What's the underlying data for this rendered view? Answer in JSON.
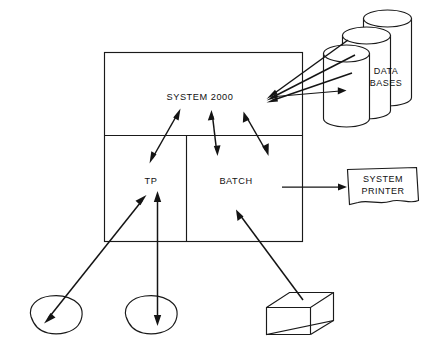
{
  "diagram": {
    "title_text": "SYSTEM 2000",
    "nodes": {
      "system": {
        "label": "SYSTEM 2000",
        "name": "system-2000-box"
      },
      "tp": {
        "label": "TP",
        "name": "tp-compartment"
      },
      "batch": {
        "label": "BATCH",
        "name": "batch-compartment"
      },
      "databases": {
        "label_line1": "DATA",
        "label_line2": "BASES",
        "name": "data-bases-cylinders",
        "count": 3
      },
      "printer": {
        "label_line1": "SYSTEM",
        "label_line2": "PRINTER",
        "name": "system-printer-box"
      },
      "terminal_left": {
        "label": "",
        "name": "terminal-left-blob"
      },
      "terminal_middle": {
        "label": "",
        "name": "terminal-middle-blob"
      },
      "card_deck": {
        "label": "",
        "name": "card-deck-box"
      }
    },
    "connections": [
      {
        "name": "databases-to-system-link-1",
        "from": "databases",
        "to": "system",
        "style": "single-arrow"
      },
      {
        "name": "databases-to-system-link-2",
        "from": "databases",
        "to": "system",
        "style": "single-arrow"
      },
      {
        "name": "databases-to-system-link-3",
        "from": "databases",
        "to": "system",
        "style": "single-arrow"
      },
      {
        "name": "system-to-databases-link",
        "from": "system",
        "to": "databases",
        "style": "single-arrow"
      },
      {
        "name": "system-to-tp-link",
        "from": "system",
        "to": "tp",
        "style": "double-arrow"
      },
      {
        "name": "system-to-batch-link-center",
        "from": "system",
        "to": "batch",
        "style": "double-arrow"
      },
      {
        "name": "system-to-batch-link-right",
        "from": "system",
        "to": "batch",
        "style": "double-arrow"
      },
      {
        "name": "batch-to-printer-link",
        "from": "batch",
        "to": "printer",
        "style": "single-arrow"
      },
      {
        "name": "terminal-left-to-tp-link",
        "from": "terminal_left",
        "to": "tp",
        "style": "double-arrow"
      },
      {
        "name": "terminal-middle-to-tp-link",
        "from": "terminal_middle",
        "to": "tp",
        "style": "double-arrow"
      },
      {
        "name": "card-deck-to-batch-link",
        "from": "card_deck",
        "to": "batch",
        "style": "single-arrow"
      }
    ],
    "colors": {
      "ink": "#1a1a1a",
      "background": "#ffffff"
    }
  }
}
